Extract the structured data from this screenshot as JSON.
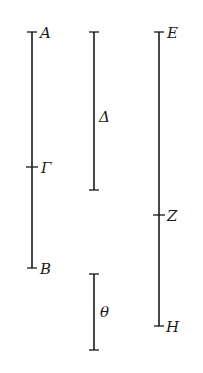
{
  "diagram": {
    "type": "line-segments",
    "segments": [
      {
        "id": "AB",
        "x": 32,
        "y_top": 32,
        "y_bottom": 268,
        "points": [
          {
            "label": "A",
            "y": 32,
            "label_x": 40,
            "label_y": 38
          },
          {
            "label": "Γ",
            "y": 167,
            "label_x": 41,
            "label_y": 173
          },
          {
            "label": "B",
            "y": 268,
            "label_x": 40,
            "label_y": 274
          }
        ]
      },
      {
        "id": "Delta",
        "x": 94,
        "y_top": 32,
        "y_bottom": 190,
        "label": "Δ",
        "label_x": 99,
        "label_y": 122
      },
      {
        "id": "Theta",
        "x": 94,
        "y_top": 274,
        "y_bottom": 350,
        "label": "θ",
        "label_x": 100,
        "label_y": 317
      },
      {
        "id": "EH",
        "x": 159,
        "y_top": 32,
        "y_bottom": 326,
        "points": [
          {
            "label": "E",
            "y": 32,
            "label_x": 167,
            "label_y": 38
          },
          {
            "label": "Z",
            "y": 215,
            "label_x": 167,
            "label_y": 221
          },
          {
            "label": "H",
            "y": 326,
            "label_x": 166,
            "label_y": 332
          }
        ]
      }
    ]
  },
  "labels": {
    "A": "A",
    "Gamma": "Γ",
    "B": "B",
    "Delta": "Δ",
    "Theta": "θ",
    "E": "E",
    "Z": "Z",
    "H": "H"
  }
}
